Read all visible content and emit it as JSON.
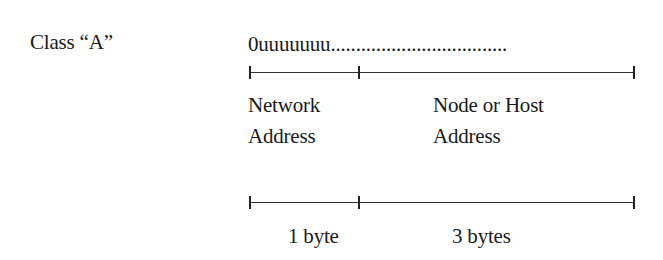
{
  "class_label": "Class “A”",
  "bit_pattern": "0uuuuuuu",
  "bit_pattern_trail": "...................................",
  "segments": [
    {
      "label_line1": "Network",
      "label_line2": "Address",
      "size": "1 byte"
    },
    {
      "label_line1": "Node or Host",
      "label_line2": "Address",
      "size": "3 bytes"
    }
  ]
}
